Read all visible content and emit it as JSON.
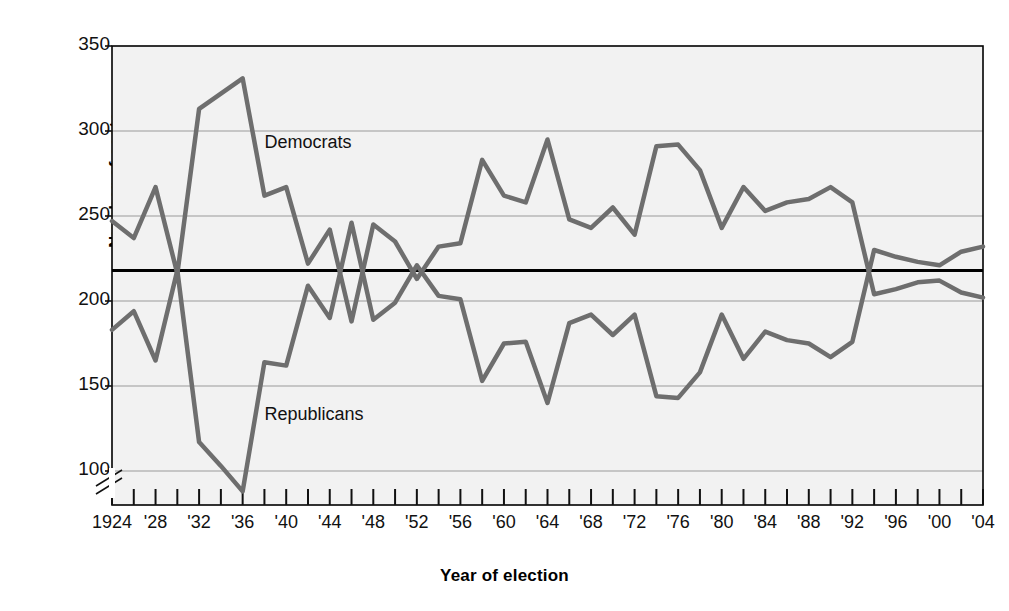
{
  "chart_data": {
    "type": "line",
    "title": "",
    "xlabel": "Year of election",
    "ylabel": "Number of seats",
    "ylim": [
      80,
      350
    ],
    "yticks": [
      100,
      150,
      200,
      250,
      300,
      350
    ],
    "ytick_labels": [
      "100",
      "150",
      "200",
      "250",
      "300",
      "350"
    ],
    "y_axis_break": true,
    "grid": true,
    "legend_position": "inline-annotations",
    "xlim": [
      1924,
      2004
    ],
    "x": [
      1924,
      1926,
      1928,
      1930,
      1932,
      1934,
      1936,
      1938,
      1940,
      1942,
      1944,
      1946,
      1948,
      1950,
      1952,
      1954,
      1956,
      1958,
      1960,
      1962,
      1964,
      1966,
      1968,
      1970,
      1972,
      1974,
      1976,
      1978,
      1980,
      1982,
      1984,
      1986,
      1988,
      1990,
      1992,
      1994,
      1996,
      1998,
      2000,
      2002,
      2004
    ],
    "xtick_labels": [
      "1924",
      "'28",
      "'32",
      "'36",
      "'40",
      "'44",
      "'48",
      "'52",
      "'56",
      "'60",
      "'64",
      "'68",
      "'72",
      "'76",
      "'80",
      "'84",
      "'88",
      "'92",
      "'96",
      "'00",
      "'04"
    ],
    "xtick_years": [
      1924,
      1928,
      1932,
      1936,
      1940,
      1944,
      1948,
      1952,
      1956,
      1960,
      1964,
      1968,
      1972,
      1976,
      1980,
      1984,
      1988,
      1992,
      1996,
      2000,
      2004
    ],
    "xtick_minor_years": [
      1926,
      1930,
      1934,
      1938,
      1942,
      1946,
      1950,
      1954,
      1958,
      1962,
      1966,
      1970,
      1974,
      1978,
      1982,
      1986,
      1990,
      1994,
      1998,
      2002
    ],
    "reference_line": {
      "value": 218,
      "label": "",
      "color": "#000000",
      "width": 3
    },
    "series": [
      {
        "name": "Democrats",
        "color": "#6e6e6e",
        "annotation": "Democrats",
        "annotation_year": 1938,
        "annotation_value": 290,
        "values": [
          247,
          237,
          267,
          216,
          313,
          322,
          331,
          262,
          267,
          222,
          242,
          188,
          245,
          235,
          213,
          232,
          234,
          283,
          262,
          258,
          295,
          248,
          243,
          255,
          239,
          291,
          292,
          277,
          243,
          267,
          253,
          258,
          260,
          267,
          258,
          204,
          207,
          211,
          212,
          205,
          202
        ]
      },
      {
        "name": "Republicans",
        "color": "#6e6e6e",
        "annotation": "Republicans",
        "annotation_year": 1938,
        "annotation_value": 130,
        "values": [
          183,
          194,
          165,
          218,
          117,
          103,
          88,
          164,
          162,
          209,
          190,
          246,
          189,
          199,
          221,
          203,
          201,
          153,
          175,
          176,
          140,
          187,
          192,
          180,
          192,
          144,
          143,
          158,
          192,
          166,
          182,
          177,
          175,
          167,
          176,
          230,
          226,
          223,
          221,
          229,
          232
        ]
      }
    ]
  },
  "axes": {
    "y_title": "Number of seats",
    "x_title": "Year of election"
  }
}
